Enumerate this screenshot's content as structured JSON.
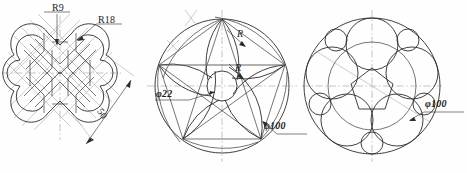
{
  "page": {
    "background_color": "#fefefe",
    "line_color": "#2b2b2b",
    "construction_color": "#9a9a9a",
    "width": 467,
    "height": 173
  },
  "figures": [
    {
      "id": "endless-knot",
      "name": "Chinese endless knot ribbon pattern",
      "position": "left",
      "labels": [
        {
          "key": "r9",
          "text": "R9",
          "kind": "radius"
        },
        {
          "key": "r18",
          "text": "R18",
          "kind": "radius"
        },
        {
          "key": "d50",
          "text": "50",
          "kind": "linear",
          "rotated": true
        }
      ]
    },
    {
      "id": "spiral-rosette",
      "name": "Five-point spiral rosette construction",
      "position": "center",
      "labels": [
        {
          "key": "phi22",
          "text": "φ22",
          "kind": "diameter"
        },
        {
          "key": "phi100",
          "text": "φ100",
          "kind": "diameter"
        },
        {
          "key": "r_upper",
          "text": "R",
          "kind": "radius"
        },
        {
          "key": "r_lower",
          "text": "R",
          "kind": "radius"
        }
      ]
    },
    {
      "id": "circle-packing",
      "name": "Pentagonal circle packing inside bounding circle",
      "position": "right",
      "labels": [
        {
          "key": "phi100",
          "text": "φ100",
          "kind": "diameter"
        }
      ]
    }
  ]
}
